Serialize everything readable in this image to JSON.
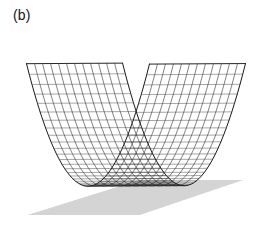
{
  "figure": {
    "panel_label": "(b)",
    "width": 272,
    "height": 228,
    "background_color": "#ffffff"
  },
  "colors": {
    "mesh_line": "#1a1a1a",
    "mesh_line_light": "#555555",
    "ground_plane": "#d4d4d4",
    "ground_plane_edge": "#cccccc",
    "label_text": "#141414"
  },
  "chart_data": {
    "type": "surface",
    "title": "",
    "subtitle": "",
    "xlabel": "",
    "ylabel": "",
    "zlabel": "",
    "annotations": [
      "(b)"
    ],
    "legend": [],
    "grid": true,
    "surface_kind": "parabolic-trough",
    "equation": "z = x^2",
    "xlim": [
      -1,
      1
    ],
    "ylim": [
      -1,
      1
    ],
    "zlim": [
      0,
      1
    ],
    "u_samples": 46,
    "v_samples": 13,
    "u_label": "x",
    "v_label": "y",
    "wire_u_count": 46,
    "wire_v_count": 13,
    "x_values": [
      -1,
      -0.9556,
      -0.9111,
      -0.8667,
      -0.8222,
      -0.7778,
      -0.7333,
      -0.6889,
      -0.6444,
      -0.6,
      -0.5556,
      -0.5111,
      -0.4667,
      -0.4222,
      -0.3778,
      -0.3333,
      -0.2889,
      -0.2444,
      -0.2,
      -0.1556,
      -0.1111,
      -0.0667,
      -0.0222,
      0.0222,
      0.0667,
      0.1111,
      0.1556,
      0.2,
      0.2444,
      0.2889,
      0.3333,
      0.3778,
      0.4222,
      0.4667,
      0.5111,
      0.5556,
      0.6,
      0.6444,
      0.6889,
      0.7333,
      0.7778,
      0.8222,
      0.8667,
      0.9111,
      0.9556,
      1
    ],
    "y_values": [
      -1,
      -0.8333,
      -0.6667,
      -0.5,
      -0.3333,
      -0.1667,
      0,
      0.1667,
      0.3333,
      0.5,
      0.6667,
      0.8333,
      1
    ],
    "z_profile": [
      1,
      0.9132,
      0.8301,
      0.7511,
      0.6761,
      0.6049,
      0.5378,
      0.4746,
      0.4153,
      0.36,
      0.3086,
      0.2612,
      0.2178,
      0.1783,
      0.1427,
      0.1111,
      0.0835,
      0.0598,
      0.04,
      0.0242,
      0.0123,
      0.0044,
      0.0005,
      0.0005,
      0.0044,
      0.0123,
      0.0242,
      0.04,
      0.0598,
      0.0835,
      0.1111,
      0.1427,
      0.1783,
      0.2178,
      0.2612,
      0.3086,
      0.36,
      0.4153,
      0.4746,
      0.5378,
      0.6049,
      0.6761,
      0.7511,
      0.8301,
      0.9132,
      1
    ],
    "projection": {
      "type": "orthographic",
      "azimuth_deg": 38,
      "elevation_deg": 22,
      "scale_x": 78,
      "scale_y": 78,
      "scale_z": 132,
      "origin_x": 136,
      "origin_y": 186
    },
    "ground_plane": {
      "visible": true,
      "color": "#d4d4d4",
      "corners": [
        [
          28,
          215
        ],
        [
          140,
          180
        ],
        [
          243,
          180
        ],
        [
          140,
          215
        ]
      ],
      "extent": [
        -1.35,
        1.35
      ]
    }
  },
  "elements": {
    "plot_area_name": "surface-plot",
    "mesh_name": "wireframe-mesh",
    "ground_name": "ground-shadow-plane"
  }
}
